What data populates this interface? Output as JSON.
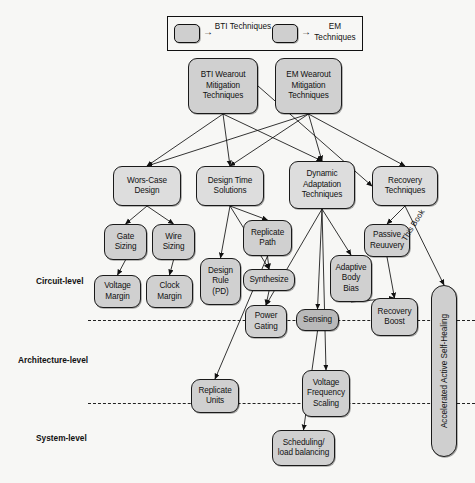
{
  "figure": {
    "background_color": "#f7f7f5",
    "node_fill": "#d0d0d0",
    "node_fill_dark": "#b9b9b9",
    "node_stroke": "#1a1a1a"
  },
  "legend": {
    "items": [
      {
        "label": "BTI\nTechniques",
        "label_line1": "BTI",
        "label_line2": "Techniques",
        "swatch": "legend-swatch-bti",
        "arrow": "arrow-right-icon"
      },
      {
        "label": "EM\nTechniques",
        "label_line1": "EM",
        "label_line2": "Techniques",
        "swatch": "legend-swatch-em",
        "arrow": "arrow-right-icon"
      }
    ]
  },
  "levels": [
    {
      "id": "circuit",
      "label": "Circuit-level"
    },
    {
      "id": "architecture",
      "label": "Architecture-level"
    },
    {
      "id": "system",
      "label": "System-level"
    }
  ],
  "annotations": [
    {
      "id": "this-book",
      "text": "This Book"
    }
  ],
  "chart_data": {
    "type": "diagram",
    "nodes": [
      {
        "id": "bti_root",
        "label": "BTI Wearout Mitigation Techniques",
        "line1": "BTI Wearout",
        "line2": "Mitigation",
        "line3": "Techniques",
        "x": 188,
        "y": 58,
        "w": 70,
        "h": 56,
        "level": "root",
        "shade": "normal"
      },
      {
        "id": "em_root",
        "label": "EM Wearout Mitigation Techniques",
        "line1": "EM Wearout",
        "line2": "Mitigation",
        "line3": "Techniques",
        "x": 275,
        "y": 58,
        "w": 67,
        "h": 56,
        "level": "root",
        "shade": "normal"
      },
      {
        "id": "worst_case",
        "label": "Wors-Case Design",
        "line1": "Wors-Case",
        "line2": "Design",
        "line3": "",
        "x": 113,
        "y": 166,
        "w": 68,
        "h": 40,
        "level": "circuit",
        "shade": "light"
      },
      {
        "id": "design_time",
        "label": "Design Time Solutions",
        "line1": "Design Time",
        "line2": "Solutions",
        "line3": "",
        "x": 196,
        "y": 166,
        "w": 68,
        "h": 40,
        "level": "circuit",
        "shade": "light"
      },
      {
        "id": "dyn_adapt",
        "label": "Dynamic Adaptation Techniques",
        "line1": "Dynamic",
        "line2": "Adaptation",
        "line3": "Techniques",
        "x": 289,
        "y": 161,
        "w": 66,
        "h": 48,
        "level": "circuit",
        "shade": "light"
      },
      {
        "id": "recovery",
        "label": "Recovery Techniques",
        "line1": "Recovery",
        "line2": "Techniques",
        "line3": "",
        "x": 372,
        "y": 166,
        "w": 66,
        "h": 40,
        "level": "circuit",
        "shade": "light"
      },
      {
        "id": "gate_sizing",
        "label": "Gate Sizing",
        "line1": "Gate",
        "line2": "Sizing",
        "line3": "",
        "x": 104,
        "y": 224,
        "w": 43,
        "h": 36,
        "level": "circuit",
        "shade": "normal"
      },
      {
        "id": "wire_sizing",
        "label": "Wire Sizing",
        "line1": "Wire",
        "line2": "Sizing",
        "line3": "",
        "x": 152,
        "y": 224,
        "w": 43,
        "h": 36,
        "level": "circuit",
        "shade": "normal"
      },
      {
        "id": "volt_margin",
        "label": "Voltage Margin",
        "line1": "Voltage",
        "line2": "Margin",
        "line3": "",
        "x": 94,
        "y": 275,
        "w": 47,
        "h": 33,
        "level": "circuit",
        "shade": "normal"
      },
      {
        "id": "clock_margin",
        "label": "Clock Margin",
        "line1": "Clock",
        "line2": "Margin",
        "line3": "",
        "x": 146,
        "y": 275,
        "w": 47,
        "h": 33,
        "level": "circuit",
        "shade": "normal"
      },
      {
        "id": "design_rule",
        "label": "Design Rule (PD)",
        "line1": "Design",
        "line2": "Rule",
        "line3": "(PD)",
        "x": 200,
        "y": 258,
        "w": 41,
        "h": 47,
        "level": "circuit",
        "shade": "normal"
      },
      {
        "id": "replicate_path",
        "label": "Replicate Path",
        "line1": "Replicate",
        "line2": "Path",
        "line3": "",
        "x": 243,
        "y": 220,
        "w": 49,
        "h": 36,
        "level": "circuit",
        "shade": "normal"
      },
      {
        "id": "synthesize",
        "label": "Synthesize",
        "line1": "Synthesize",
        "line2": "",
        "line3": "",
        "x": 243,
        "y": 269,
        "w": 52,
        "h": 22,
        "level": "circuit",
        "shade": "normal"
      },
      {
        "id": "power_gating",
        "label": "Power Gating",
        "line1": "Power",
        "line2": "Gating",
        "line3": "",
        "x": 245,
        "y": 305,
        "w": 42,
        "h": 33,
        "level": "circuit",
        "shade": "normal"
      },
      {
        "id": "sensing",
        "label": "Sensing",
        "line1": "Sensing",
        "line2": "",
        "line3": "",
        "x": 296,
        "y": 309,
        "w": 43,
        "h": 22,
        "level": "circuit",
        "shade": "dark"
      },
      {
        "id": "adaptive_body",
        "label": "Adaptive Body Bias",
        "line1": "Adaptive",
        "line2": "Body",
        "line3": "Bias",
        "x": 330,
        "y": 255,
        "w": 42,
        "h": 47,
        "level": "circuit",
        "shade": "normal"
      },
      {
        "id": "passive_rec",
        "label": "Passive Reuuvery",
        "line1": "Passive",
        "line2": "Reuuvery",
        "line3": "",
        "x": 364,
        "y": 224,
        "w": 46,
        "h": 33,
        "level": "circuit",
        "shade": "normal"
      },
      {
        "id": "recovery_boost",
        "label": "Recovery Boost",
        "line1": "Recovery",
        "line2": "Boost",
        "line3": "",
        "x": 371,
        "y": 298,
        "w": 47,
        "h": 38,
        "level": "circuit",
        "shade": "normal"
      },
      {
        "id": "replicate_units",
        "label": "Replicate Units",
        "line1": "Replicate",
        "line2": "Units",
        "line3": "",
        "x": 191,
        "y": 379,
        "w": 48,
        "h": 34,
        "level": "architecture",
        "shade": "normal"
      },
      {
        "id": "vf_scaling",
        "label": "Voltage Frequency Scaling",
        "line1": "Voltage",
        "line2": "Frequency",
        "line3": "Scaling",
        "x": 302,
        "y": 370,
        "w": 48,
        "h": 47,
        "level": "architecture",
        "shade": "normal"
      },
      {
        "id": "scheduling",
        "label": "Scheduling/ load balancing",
        "line1": "Scheduling/",
        "line2": "load balancing",
        "line3": "",
        "x": 272,
        "y": 430,
        "w": 63,
        "h": 36,
        "level": "system",
        "shade": "normal"
      },
      {
        "id": "self_healing",
        "label": "Accelerated Active Self-Healing",
        "line1": "Accelerated Active Self-Healing",
        "line2": "",
        "line3": "",
        "x": 431,
        "y": 285,
        "w": 26,
        "h": 172,
        "level": "all",
        "shade": "normal",
        "orientation": "vertical"
      }
    ],
    "edges": [
      {
        "from": "bti_root",
        "to": "worst_case"
      },
      {
        "from": "bti_root",
        "to": "design_time"
      },
      {
        "from": "bti_root",
        "to": "dyn_adapt"
      },
      {
        "from": "bti_root",
        "to": "recovery"
      },
      {
        "from": "em_root",
        "to": "worst_case"
      },
      {
        "from": "em_root",
        "to": "design_time"
      },
      {
        "from": "em_root",
        "to": "dyn_adapt"
      },
      {
        "from": "em_root",
        "to": "recovery"
      },
      {
        "from": "worst_case",
        "to": "gate_sizing"
      },
      {
        "from": "worst_case",
        "to": "wire_sizing"
      },
      {
        "from": "gate_sizing",
        "to": "volt_margin"
      },
      {
        "from": "wire_sizing",
        "to": "clock_margin"
      },
      {
        "from": "design_time",
        "to": "design_rule"
      },
      {
        "from": "design_time",
        "to": "replicate_path"
      },
      {
        "from": "design_time",
        "to": "synthesize"
      },
      {
        "from": "replicate_path",
        "to": "synthesize"
      },
      {
        "from": "replicate_path",
        "to": "replicate_units"
      },
      {
        "from": "synthesize",
        "to": "power_gating"
      },
      {
        "from": "dyn_adapt",
        "to": "power_gating"
      },
      {
        "from": "dyn_adapt",
        "to": "sensing"
      },
      {
        "from": "dyn_adapt",
        "to": "adaptive_body"
      },
      {
        "from": "dyn_adapt",
        "to": "vf_scaling"
      },
      {
        "from": "recovery",
        "to": "passive_rec"
      },
      {
        "from": "recovery",
        "to": "self_healing"
      },
      {
        "from": "passive_rec",
        "to": "recovery_boost"
      },
      {
        "from": "sensing",
        "to": "scheduling"
      },
      {
        "from": "adaptive_body",
        "to": "recovery_boost"
      }
    ],
    "dividers": [
      {
        "id": "circuit-architecture-divider",
        "y": 320,
        "x1": 88,
        "x2": 475
      },
      {
        "id": "architecture-system-divider",
        "y": 403,
        "x1": 88,
        "x2": 475
      }
    ]
  }
}
